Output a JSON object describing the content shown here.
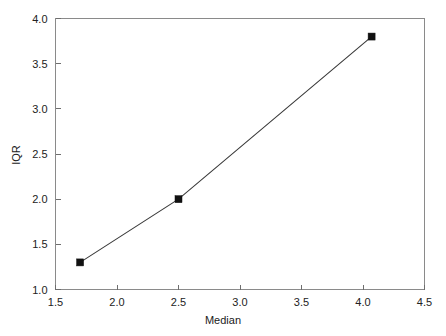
{
  "chart_data": {
    "type": "line",
    "title": "",
    "xlabel": "Median",
    "ylabel": "IQR",
    "xlim": [
      1.5,
      4.5
    ],
    "ylim": [
      1.0,
      4.0
    ],
    "xticks": [
      1.5,
      2.0,
      2.5,
      3.0,
      3.5,
      4.0,
      4.5
    ],
    "xtick_labels": [
      "1.5",
      "2.0",
      "2.5",
      "3.0",
      "3.5",
      "4.0",
      "4.5"
    ],
    "yticks": [
      1.0,
      1.5,
      2.0,
      2.5,
      3.0,
      3.5,
      4.0
    ],
    "ytick_labels": [
      "1.0",
      "1.5",
      "2.0",
      "2.5",
      "3.0",
      "3.5",
      "4.0"
    ],
    "grid": false,
    "legend": null,
    "marker": "filled-square",
    "line_color": "#3a3a3a",
    "marker_color": "#111111",
    "series": [
      {
        "name": "IQR vs Median",
        "x": [
          1.7,
          2.5,
          4.07
        ],
        "y": [
          1.3,
          2.0,
          3.8
        ]
      }
    ]
  },
  "axes": {
    "x_title": "Median",
    "y_title": "IQR"
  },
  "colors": {
    "background": "#ffffff",
    "frame": "#8a8a8a",
    "tick": "#6e6e6e",
    "text": "#222222",
    "line": "#3a3a3a",
    "marker": "#111111"
  }
}
